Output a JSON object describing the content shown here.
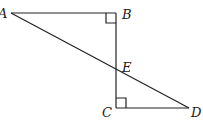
{
  "diagram": {
    "type": "geometry",
    "points": {
      "A": {
        "label": "A",
        "x": 11,
        "y": 13
      },
      "B": {
        "label": "B",
        "x": 116,
        "y": 13
      },
      "C": {
        "label": "C",
        "x": 116,
        "y": 108
      },
      "D": {
        "label": "D",
        "x": 189,
        "y": 108
      },
      "E": {
        "label": "E",
        "x": 116,
        "y": 70
      }
    },
    "segments": [
      "AB",
      "BC",
      "CD",
      "AD"
    ],
    "right_angles": [
      "B",
      "C"
    ],
    "stroke_color": "#222222"
  }
}
